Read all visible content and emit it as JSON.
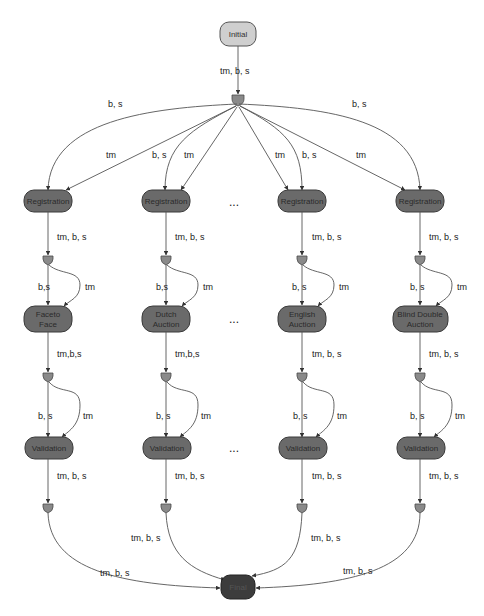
{
  "diagram": {
    "initial": {
      "label": "Initial"
    },
    "final": {
      "label": "Final"
    },
    "start_edge_label": "tm, b, s",
    "fanout_labels": {
      "col1_bs": "b, s",
      "col1_tm": "tm",
      "col2_bs": "b, s",
      "col2_tm": "tm",
      "col3_tm": "tm",
      "col3_bs": "b, s",
      "col4_tm": "tm",
      "col4_bs": "b, s"
    },
    "ellipsis": "...",
    "columns": [
      {
        "registration": "Registration",
        "auction_line1": "Faceto",
        "auction_line2": "Face",
        "validation": "Validation",
        "reg_out": "tm, b, s",
        "auc_bs": "b,s",
        "auc_tm": "tm",
        "auc_out": "tm,b,s",
        "val_bs": "b, s",
        "val_tm": "tm",
        "val_out": "tm, b, s",
        "final_edge": "tm, b, s"
      },
      {
        "registration": "Registration",
        "auction_line1": "Dutch",
        "auction_line2": "Auction",
        "validation": "Validation",
        "reg_out": "tm, b, s",
        "auc_bs": "b,s",
        "auc_tm": "tm",
        "auc_out": "tm,b,s",
        "val_bs": "b, s",
        "val_tm": "tm",
        "val_out": "tm, b, s",
        "final_edge": "tm, b, s"
      },
      {
        "registration": "Registration",
        "auction_line1": "English",
        "auction_line2": "Auction",
        "validation": "Validation",
        "reg_out": "tm, b, s",
        "auc_bs": "b, s",
        "auc_tm": "tm",
        "auc_out": "tm, b, s",
        "val_bs": "b, s",
        "val_tm": "tm",
        "val_out": "tm, b, s",
        "final_edge": "tm, b, s"
      },
      {
        "registration": "Registration",
        "auction_line1": "Blind Double",
        "auction_line2": "Auction",
        "validation": "Validation",
        "reg_out": "tm, b, s",
        "auc_bs": "b, s",
        "auc_tm": "tm",
        "auc_out": "tm, b, s",
        "val_bs": "b, s",
        "val_tm": "tm",
        "val_out": "tm, b, s",
        "final_edge": "tm, b, s"
      }
    ]
  }
}
